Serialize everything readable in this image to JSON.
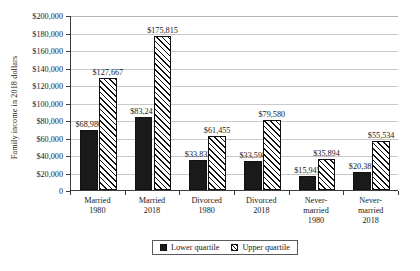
{
  "chart_data": {
    "type": "bar",
    "title": "",
    "subtitle": "",
    "xlabel": "",
    "ylabel": "Family income in 2018 dollars",
    "categories": [
      "Married 1980",
      "Married 2018",
      "Divorced 1980",
      "Divorced 2018",
      "Never-married 1980",
      "Never-married 2018"
    ],
    "category_lines": [
      [
        "Married",
        "1980"
      ],
      [
        "Married",
        "2018"
      ],
      [
        "Divorced",
        "1980"
      ],
      [
        "Divorced",
        "2018"
      ],
      [
        "Never-",
        "married",
        "1980"
      ],
      [
        "Never-",
        "married",
        "2018"
      ]
    ],
    "series": [
      {
        "name": "Lower quartile",
        "values": [
          68980,
          83241,
          33833,
          33598,
          15945,
          20385
        ],
        "labels": [
          "$68,980",
          "$83,241",
          "$33,833",
          "$33,598",
          "$15,945",
          "$20,385"
        ],
        "fill": "solid-black",
        "color": "#1a1a1a"
      },
      {
        "name": "Upper quartile",
        "values": [
          127667,
          175815,
          61455,
          79580,
          35894,
          55534
        ],
        "labels": [
          "$127,667",
          "$175,815",
          "$61,455",
          "$79,580",
          "$35,894",
          "$55,534"
        ],
        "fill": "diagonal-hatch",
        "color": "#ffffff"
      }
    ],
    "ylim": [
      0,
      200000
    ],
    "ytick_step": 20000,
    "ytick_values": [
      0,
      20000,
      40000,
      60000,
      80000,
      100000,
      120000,
      140000,
      160000,
      180000,
      200000
    ],
    "ytick_labels": [
      "0",
      "$20,000",
      "$40,000",
      "$60,000",
      "$80,000",
      "$100,000",
      "$120,000",
      "$140,000",
      "$160,000",
      "$180,000",
      "$200,000"
    ],
    "grid": true,
    "grid_axis": "y",
    "legend": {
      "position": "bottom-center",
      "bordered": true,
      "entries": [
        {
          "label": "Lower quartile",
          "fill": "solid-black"
        },
        {
          "label": "Upper quartile",
          "fill": "diagonal-hatch"
        }
      ]
    }
  }
}
